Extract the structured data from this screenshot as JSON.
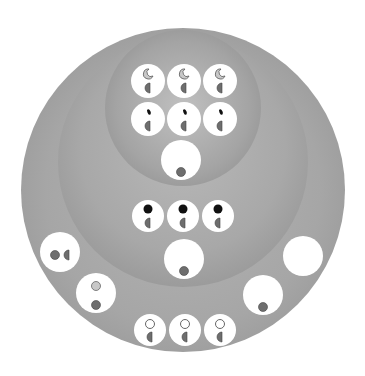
{
  "diagram": {
    "title": "",
    "colors": {
      "outer_ring": "#a6a6a6",
      "middle_ring": "#a8a8a8",
      "inner_ring": "#a4a4a4",
      "cell": "#ffffff",
      "nucleus_gray": "#6e6e6e",
      "light_gray": "#c8c8c8",
      "black": "#111111"
    },
    "rings": [
      {
        "name": "outer",
        "cx": 183,
        "cy": 190,
        "r": 162
      },
      {
        "name": "middle",
        "cx": 183,
        "cy": 162,
        "r": 125
      },
      {
        "name": "inner",
        "cx": 183,
        "cy": 108,
        "r": 78
      }
    ],
    "cells": [
      {
        "group": "inner-row1",
        "cx": 148,
        "cy": 81,
        "r": 17,
        "top": "light-crescent",
        "bottom": "half-disc"
      },
      {
        "group": "inner-row1",
        "cx": 184,
        "cy": 81,
        "r": 17,
        "top": "light-crescent",
        "bottom": "half-disc"
      },
      {
        "group": "inner-row1",
        "cx": 220,
        "cy": 81,
        "r": 17,
        "top": "light-crescent",
        "bottom": "half-disc"
      },
      {
        "group": "inner-row2",
        "cx": 148,
        "cy": 119,
        "r": 17,
        "top": "black-fleck",
        "bottom": "half-disc"
      },
      {
        "group": "inner-row2",
        "cx": 184,
        "cy": 119,
        "r": 17,
        "top": "black-fleck",
        "bottom": "half-disc"
      },
      {
        "group": "inner-row2",
        "cx": 220,
        "cy": 119,
        "r": 17,
        "top": "black-fleck",
        "bottom": "half-disc"
      },
      {
        "group": "inner-large",
        "cx": 181,
        "cy": 160,
        "r": 20,
        "top": "none",
        "bottom": "gray-dot"
      },
      {
        "group": "middle-row",
        "cx": 148,
        "cy": 216,
        "r": 16,
        "top": "black-dot",
        "bottom": "half-disc"
      },
      {
        "group": "middle-row",
        "cx": 183,
        "cy": 216,
        "r": 16,
        "top": "black-dot",
        "bottom": "half-disc"
      },
      {
        "group": "middle-row",
        "cx": 218,
        "cy": 216,
        "r": 16,
        "top": "black-dot",
        "bottom": "half-disc"
      },
      {
        "group": "middle-large",
        "cx": 184,
        "cy": 259,
        "r": 20,
        "top": "none",
        "bottom": "gray-dot"
      },
      {
        "group": "outer-left-upper",
        "cx": 60,
        "cy": 252,
        "r": 20,
        "top": "side-pair",
        "bottom": "none"
      },
      {
        "group": "outer-left-lower",
        "cx": 96,
        "cy": 293,
        "r": 20,
        "top": "light-dot",
        "bottom": "gray-dot"
      },
      {
        "group": "outer-right-upper",
        "cx": 303,
        "cy": 256,
        "r": 20,
        "top": "none",
        "bottom": "none"
      },
      {
        "group": "outer-right-lower",
        "cx": 263,
        "cy": 295,
        "r": 20,
        "top": "none",
        "bottom": "gray-dot"
      },
      {
        "group": "outer-bottom-row",
        "cx": 150,
        "cy": 330,
        "r": 16,
        "top": "open-circle",
        "bottom": "half-disc"
      },
      {
        "group": "outer-bottom-row",
        "cx": 185,
        "cy": 330,
        "r": 16,
        "top": "open-circle",
        "bottom": "half-disc"
      },
      {
        "group": "outer-bottom-row",
        "cx": 220,
        "cy": 330,
        "r": 16,
        "top": "open-circle",
        "bottom": "half-disc"
      }
    ]
  }
}
